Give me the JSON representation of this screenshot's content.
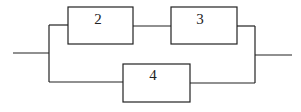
{
  "diagram": {
    "type": "reliability-block-diagram",
    "blocks": [
      {
        "id": "block-2",
        "label": "2"
      },
      {
        "id": "block-3",
        "label": "3"
      },
      {
        "id": "block-4",
        "label": "4"
      }
    ],
    "connections": [
      {
        "from": "input",
        "to": "block-2"
      },
      {
        "from": "block-2",
        "to": "block-3"
      },
      {
        "from": "block-3",
        "to": "output"
      },
      {
        "from": "input",
        "to": "block-4"
      },
      {
        "from": "block-4",
        "to": "output"
      }
    ],
    "colors": {
      "stroke": "#222222",
      "background": "#ffffff"
    }
  }
}
